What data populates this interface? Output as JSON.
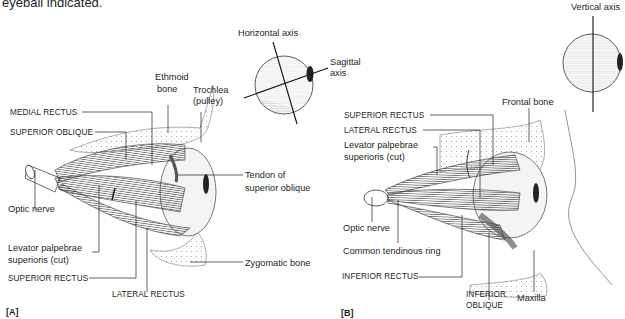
{
  "caption": {
    "text": "eyeball indicated."
  },
  "panels": [
    {
      "id": "A",
      "label": "[A]",
      "axis_diagram": {
        "horizontal_axis": "Horizontal axis",
        "sagittal_axis_line1": "Sagittal",
        "sagittal_axis_line2": "axis"
      },
      "labels": {
        "medial_rectus": "MEDIAL RECTUS",
        "superior_oblique": "SUPERIOR OBLIQUE",
        "ethmoid_line1": "Ethmoid",
        "ethmoid_line2": "bone",
        "trochlea_line1": "Trochlea",
        "trochlea_line2": "(pulley)",
        "tendon_line1": "Tendon of",
        "tendon_line2": "superior oblique",
        "optic_nerve": "Optic nerve",
        "levator_line1": "Levator palpebrae",
        "levator_line2": "superioris (cut)",
        "superior_rectus": "SUPERIOR RECTUS",
        "lateral_rectus": "LATERAL RECTUS",
        "zygomatic": "Zygomatic bone"
      }
    },
    {
      "id": "B",
      "label": "[B]",
      "axis_diagram": {
        "vertical_axis": "Vertical axis"
      },
      "labels": {
        "superior_rectus": "SUPERIOR RECTUS",
        "lateral_rectus": "LATERAL RECTUS",
        "levator_line1": "Levator palpebrae",
        "levator_line2": "superioris (cut)",
        "frontal_bone": "Frontal bone",
        "optic_nerve": "Optic nerve",
        "common_ring": "Common tendinous ring",
        "inferior_rectus": "INFERIOR RECTUS",
        "inferior_oblique_line1": "INFERIOR",
        "inferior_oblique_line2": "OBLIQUE",
        "maxilla": "Maxilla"
      }
    }
  ],
  "colors": {
    "ink": "#231f20",
    "muscle": "#6b6b6b",
    "bone": "#ebebeb",
    "globe": "#f4f4f4"
  }
}
